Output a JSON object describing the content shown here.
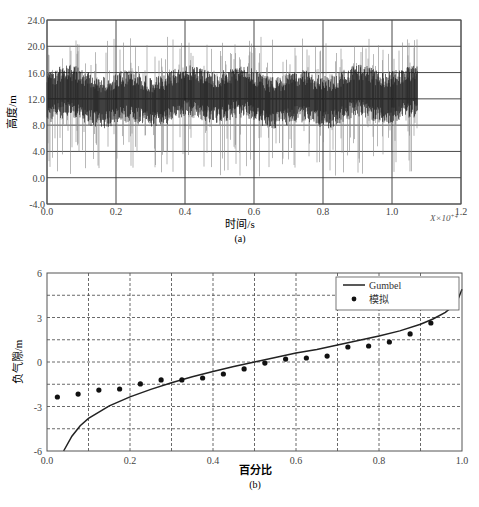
{
  "chart_data": [
    {
      "id": "a",
      "type": "line",
      "title": "",
      "caption": "(a)",
      "xlabel": "时间/s",
      "ylabel": "高度/m",
      "x_scale_note": "X×10^4",
      "xlim": [
        0.0,
        1.2
      ],
      "ylim": [
        -4.0,
        24.0
      ],
      "xticks": [
        "0.0",
        "0.2",
        "0.4",
        "0.6",
        "0.8",
        "1.0",
        "1.2"
      ],
      "yticks": [
        "-4.0",
        "0.0",
        "4.0",
        "8.0",
        "12.0",
        "16.0",
        "20.0",
        "24.0"
      ],
      "grid": true,
      "series": [
        {
          "name": "wave elevation time series",
          "description": "dense random signal from x=0 to ~1.075 (×10^4 s), mean ~12.5 m, core band ~9-16 m, peaks up to ~21.5 m, troughs down to ~0 m",
          "x_range": [
            0.0,
            1.075
          ],
          "mean": 12.5,
          "core_band": [
            9.0,
            16.0
          ],
          "max": 21.5,
          "min": 0.0
        }
      ]
    },
    {
      "id": "b",
      "type": "scatter",
      "title": "",
      "caption": "(b)",
      "xlabel": "百分比",
      "ylabel": "负气隙/m",
      "xlim": [
        0.0,
        1.0
      ],
      "ylim": [
        -6,
        6
      ],
      "xticks": [
        "0.0",
        "0.2",
        "0.4",
        "0.6",
        "0.8",
        "1.0"
      ],
      "yticks": [
        "-6",
        "-3",
        "0",
        "3",
        "6"
      ],
      "grid": "dashed",
      "legend": {
        "position": "upper right",
        "entries": [
          "Gumbel",
          "模拟"
        ]
      },
      "series": [
        {
          "name": "Gumbel",
          "kind": "line",
          "x": [
            0.04,
            0.06,
            0.08,
            0.1,
            0.15,
            0.2,
            0.25,
            0.3,
            0.35,
            0.4,
            0.45,
            0.5,
            0.55,
            0.6,
            0.65,
            0.7,
            0.75,
            0.8,
            0.85,
            0.9,
            0.93,
            0.96,
            0.98,
            0.99,
            1.0
          ],
          "y": [
            -6.0,
            -5.0,
            -4.3,
            -3.8,
            -2.95,
            -2.35,
            -1.85,
            -1.4,
            -1.0,
            -0.65,
            -0.3,
            0.0,
            0.3,
            0.6,
            0.85,
            1.15,
            1.45,
            1.75,
            2.1,
            2.55,
            2.9,
            3.35,
            3.8,
            4.2,
            4.9
          ]
        },
        {
          "name": "模拟",
          "kind": "scatter",
          "x": [
            0.025,
            0.075,
            0.125,
            0.175,
            0.225,
            0.275,
            0.325,
            0.375,
            0.425,
            0.475,
            0.525,
            0.575,
            0.625,
            0.675,
            0.725,
            0.775,
            0.825,
            0.875,
            0.925,
            0.975
          ],
          "y": [
            -2.36,
            -2.16,
            -1.89,
            -1.82,
            -1.48,
            -1.21,
            -1.21,
            -1.08,
            -0.81,
            -0.47,
            -0.07,
            0.2,
            0.27,
            0.4,
            1.01,
            1.08,
            1.35,
            1.89,
            2.63,
            4.92
          ]
        }
      ]
    }
  ],
  "labels": {
    "a_caption": "(a)",
    "a_xlabel": "时间/s",
    "a_ylabel": "高度/m",
    "a_xscale": "X×10",
    "a_xscale_exp": "+4",
    "b_caption": "(b)",
    "b_xlabel": "百分比",
    "b_ylabel": "负气隙/m",
    "legend_line": "Gumbel",
    "legend_dot": "模拟"
  },
  "colors": {
    "axis": "#555555",
    "signal_dark": "#111111",
    "signal_light": "#888888",
    "curve": "#222222",
    "points": "#111111",
    "grid_a": "#333333",
    "grid_b": "#444444"
  }
}
